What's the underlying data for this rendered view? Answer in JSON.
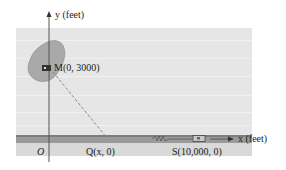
{
  "labels": {
    "y_axis": "y (feet)",
    "x_axis": "x (feet)",
    "origin": "O",
    "point_M": "M(0, 3000)",
    "point_Q": "Q(x, 0)",
    "point_S": "S(10,000, 0)"
  },
  "colors": {
    "background": "#e6e6e6",
    "island": "#a9a9a9",
    "road": "#9a9a9a",
    "axis": "#555555",
    "dashed": "#888888"
  }
}
